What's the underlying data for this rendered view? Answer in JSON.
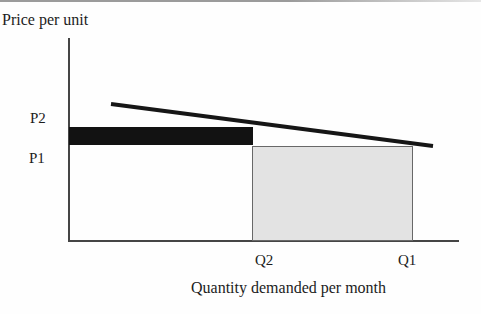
{
  "figure": {
    "ylabel": "Price per unit",
    "xlabel": "Quantity demanded per month",
    "y_ticks": [
      {
        "label": "P2"
      },
      {
        "label": "P1"
      }
    ],
    "x_ticks": [
      {
        "label": "Q2"
      },
      {
        "label": "Q1"
      }
    ]
  },
  "colors": {
    "text": "#1c1c1c",
    "axis": "#454545",
    "top-rule": "#9b9b9b",
    "gain-rect": "#121212",
    "loss-rect-fill": "#e3e3e3",
    "loss-rect-border": "#686868",
    "demand-line": "#161616"
  },
  "chart_data": {
    "type": "line",
    "title": "",
    "xlabel": "Quantity demanded per month",
    "ylabel": "Price per unit",
    "x_tick_labels": [
      "Q2",
      "Q1"
    ],
    "y_tick_labels": [
      "P2",
      "P1"
    ],
    "axes_numeric_values_shown": false,
    "grid": false,
    "legend": "none",
    "demand_line": {
      "x1": 111,
      "y1": 104,
      "x2": 433,
      "y2": 146,
      "stroke_width": 4
    },
    "shapes": [
      {
        "name": "price-rise-revenue-rectangle",
        "fill": "#121212",
        "x_from": "y-axis",
        "x_to": "Q2",
        "y_from": "P1",
        "y_to": "P2",
        "description": "Solid black rectangle between price levels P1 and P2 spanning quantity 0 to Q2"
      },
      {
        "name": "quantity-fall-revenue-rectangle",
        "fill": "#e3e3e3",
        "x_from": "Q2",
        "x_to": "Q1",
        "y_from": "0",
        "y_to": "P1",
        "description": "Light gray rectangle between quantities Q2 and Q1 spanning price 0 to P1"
      }
    ],
    "relationships": "Demand line slopes downward from left to right; P2 > P1 on price axis; Q2 < Q1 on quantity axis"
  }
}
